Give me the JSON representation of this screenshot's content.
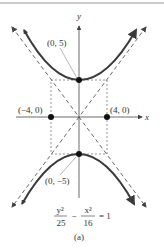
{
  "figure": {
    "caption": "(a)",
    "equation": {
      "num1": "y²",
      "den1": "25",
      "minus": "−",
      "num2": "x²",
      "den2": "16",
      "rhs": "= 1"
    },
    "axes": {
      "x_label": "x",
      "y_label": "y"
    },
    "points": [
      {
        "label": "(0, 5)",
        "x": 0,
        "y": 5
      },
      {
        "label": "(0, −5)",
        "x": 0,
        "y": -5
      },
      {
        "label": "(−4, 0)",
        "x": -4,
        "y": 0
      },
      {
        "label": "(4, 0)",
        "x": 4,
        "y": 0
      }
    ],
    "colors": {
      "curve": "#3a3a3a",
      "dashed": "#555555",
      "point": "#111111",
      "axis": "#444444"
    }
  }
}
